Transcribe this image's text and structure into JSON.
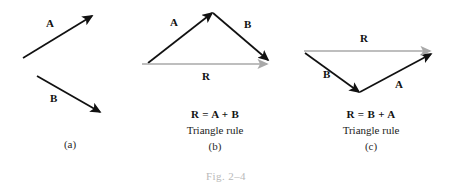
{
  "figure": {
    "number_label": "Fig. 2–4",
    "resultant_color": "#a9a9a9",
    "vector_color": "#111111"
  },
  "panels": [
    {
      "id": "a",
      "letter": "(a)",
      "equation": "",
      "rule": "",
      "vectors": [
        {
          "name": "A",
          "label": "A",
          "color": "#111111"
        },
        {
          "name": "B",
          "label": "B",
          "color": "#111111"
        }
      ]
    },
    {
      "id": "b",
      "letter": "(b)",
      "equation": "R = A + B",
      "rule": "Triangle rule",
      "vectors": [
        {
          "name": "A",
          "label": "A",
          "color": "#111111"
        },
        {
          "name": "B",
          "label": "B",
          "color": "#111111"
        },
        {
          "name": "R",
          "label": "R",
          "color": "#a9a9a9"
        }
      ]
    },
    {
      "id": "c",
      "letter": "(c)",
      "equation": "R = B + A",
      "rule": "Triangle rule",
      "vectors": [
        {
          "name": "B",
          "label": "B",
          "color": "#111111"
        },
        {
          "name": "A",
          "label": "A",
          "color": "#111111"
        },
        {
          "name": "R",
          "label": "R",
          "color": "#a9a9a9"
        }
      ]
    }
  ]
}
